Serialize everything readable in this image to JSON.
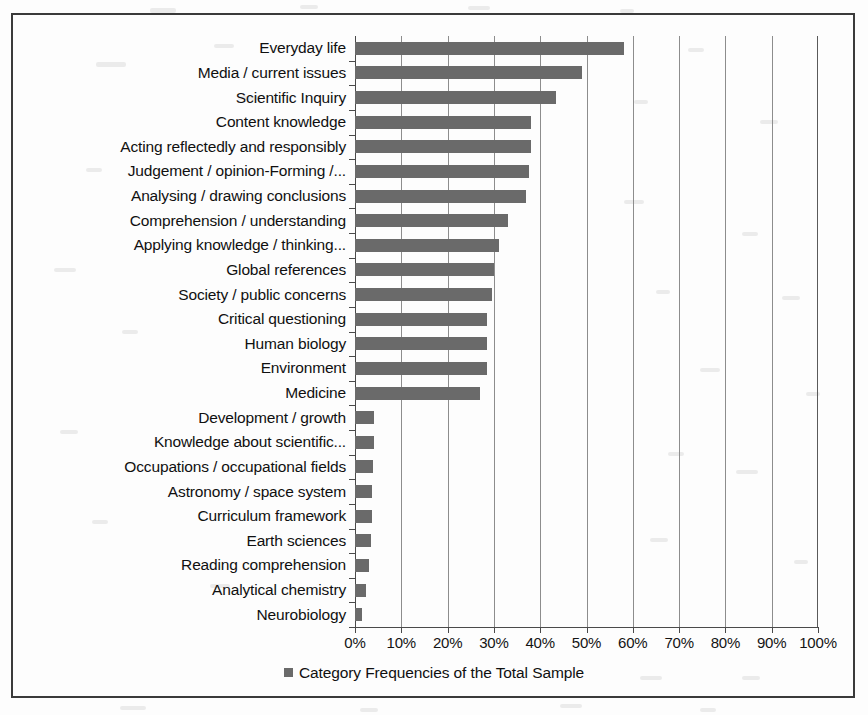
{
  "chart_data": {
    "type": "bar",
    "orientation": "horizontal",
    "title": "",
    "subtitle": "",
    "xlabel": "",
    "ylabel": "",
    "xlim": [
      0,
      100
    ],
    "xtick_step": 10,
    "grid": true,
    "legend_position": "bottom",
    "legend": [
      "Category Frequencies of the Total Sample"
    ],
    "bar_color": "#6a6a6a",
    "xticklabels": [
      "0%",
      "10%",
      "20%",
      "30%",
      "40%",
      "50%",
      "60%",
      "70%",
      "80%",
      "90%",
      "100%"
    ],
    "categories": [
      "Everyday life",
      "Media / current issues",
      "Scientific Inquiry",
      "Content knowledge",
      "Acting reflectedly and responsibly",
      "Judgement / opinion-Forming /...",
      "Analysing / drawing conclusions",
      "Comprehension / understanding",
      "Applying knowledge / thinking...",
      "Global references",
      "Society / public concerns",
      "Critical questioning",
      "Human biology",
      "Environment",
      "Medicine",
      "Development / growth",
      "Knowledge about scientific...",
      "Occupations / occupational fields",
      "Astronomy / space system",
      "Curriculum framework",
      "Earth sciences",
      "Reading comprehension",
      "Analytical chemistry",
      "Neurobiology"
    ],
    "values": [
      58,
      49,
      43.5,
      38,
      38,
      37.5,
      37,
      33,
      31,
      30,
      29.5,
      28.5,
      28.5,
      28.5,
      27,
      4,
      4,
      3.8,
      3.6,
      3.6,
      3.5,
      3,
      2.3,
      1.5
    ],
    "value_unit": "%"
  },
  "legend": {
    "marker": "square-marker",
    "label": "Category Frequencies of the Total Sample"
  }
}
